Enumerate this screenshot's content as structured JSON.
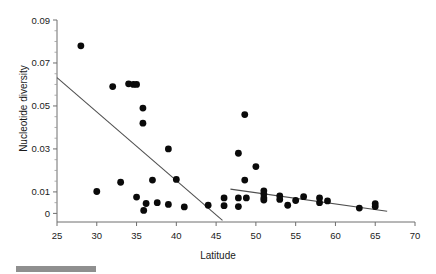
{
  "chart_data": {
    "type": "scatter",
    "title": "",
    "xlabel": "Latitude",
    "ylabel": "Nucleotide diversity",
    "xlim": [
      25,
      70
    ],
    "ylim": [
      -0.004,
      0.09
    ],
    "xticks": [
      25,
      30,
      35,
      40,
      45,
      50,
      55,
      60,
      65,
      70
    ],
    "xticklabels": [
      "25",
      "30",
      "35",
      "40",
      "45",
      "50",
      "55",
      "60",
      "65",
      "70"
    ],
    "yticks": [
      0,
      0.01,
      0.03,
      0.05,
      0.07,
      0.09
    ],
    "yticklabels": [
      "0",
      "0.01",
      "0.03",
      "0.05",
      "0.07",
      "0.09"
    ],
    "grid": false,
    "legend": null,
    "marker": "filled-circle",
    "marker_color": "#0a0a0a",
    "line_color": "#4f4f4f",
    "points": [
      {
        "x": 28.0,
        "y": 0.078
      },
      {
        "x": 30.0,
        "y": 0.0102
      },
      {
        "x": 32.0,
        "y": 0.059
      },
      {
        "x": 33.0,
        "y": 0.0145
      },
      {
        "x": 34.0,
        "y": 0.0603
      },
      {
        "x": 34.6,
        "y": 0.06
      },
      {
        "x": 35.0,
        "y": 0.06
      },
      {
        "x": 35.0,
        "y": 0.0076
      },
      {
        "x": 35.8,
        "y": 0.049
      },
      {
        "x": 35.8,
        "y": 0.042
      },
      {
        "x": 35.9,
        "y": 0.0014
      },
      {
        "x": 36.2,
        "y": 0.0046
      },
      {
        "x": 37.0,
        "y": 0.0155
      },
      {
        "x": 37.6,
        "y": 0.005
      },
      {
        "x": 39.0,
        "y": 0.03
      },
      {
        "x": 39.0,
        "y": 0.0042
      },
      {
        "x": 40.0,
        "y": 0.0158
      },
      {
        "x": 41.0,
        "y": 0.003
      },
      {
        "x": 44.0,
        "y": 0.0038
      },
      {
        "x": 46.0,
        "y": 0.0072
      },
      {
        "x": 46.0,
        "y": 0.0036
      },
      {
        "x": 47.8,
        "y": 0.028
      },
      {
        "x": 47.8,
        "y": 0.0072
      },
      {
        "x": 47.8,
        "y": 0.0032
      },
      {
        "x": 48.6,
        "y": 0.046
      },
      {
        "x": 48.6,
        "y": 0.0155
      },
      {
        "x": 48.8,
        "y": 0.0072
      },
      {
        "x": 50.0,
        "y": 0.0218
      },
      {
        "x": 51.0,
        "y": 0.0105
      },
      {
        "x": 51.0,
        "y": 0.009
      },
      {
        "x": 51.0,
        "y": 0.0072
      },
      {
        "x": 51.0,
        "y": 0.0062
      },
      {
        "x": 53.0,
        "y": 0.0082
      },
      {
        "x": 53.0,
        "y": 0.0065
      },
      {
        "x": 54.0,
        "y": 0.0038
      },
      {
        "x": 55.0,
        "y": 0.006
      },
      {
        "x": 56.0,
        "y": 0.0078
      },
      {
        "x": 58.0,
        "y": 0.0072
      },
      {
        "x": 58.0,
        "y": 0.005
      },
      {
        "x": 59.0,
        "y": 0.0058
      },
      {
        "x": 63.0,
        "y": 0.0025
      },
      {
        "x": 65.0,
        "y": 0.0045
      },
      {
        "x": 65.0,
        "y": 0.0032
      }
    ],
    "fit_lines": [
      {
        "name": "southern-trend",
        "x0": 25.0,
        "y0": 0.0632,
        "x1": 45.8,
        "y1": -0.0032
      },
      {
        "name": "northern-trend",
        "x0": 46.8,
        "y0": 0.0113,
        "x1": 66.5,
        "y1": 0.001
      }
    ]
  },
  "footer": {
    "bar_color": "#8f8f8f"
  }
}
